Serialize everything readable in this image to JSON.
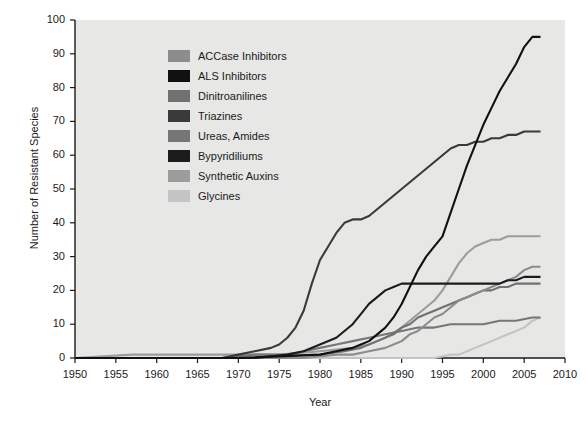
{
  "chart_data": {
    "type": "line",
    "title": "",
    "xlabel": "Year",
    "ylabel": "Number of Resistant Species",
    "xlim": [
      1950,
      2010
    ],
    "ylim": [
      0,
      100
    ],
    "xticks": [
      1950,
      1955,
      1960,
      1965,
      1970,
      1975,
      1980,
      1985,
      1990,
      1995,
      2000,
      2005,
      2010
    ],
    "yticks": [
      0,
      10,
      20,
      30,
      40,
      50,
      60,
      70,
      80,
      90,
      100
    ],
    "grid": false,
    "legend_position": "upper-left-inside",
    "background": "#e7e7e5",
    "series": [
      {
        "name": "ACCase Inhibitors",
        "color": "#8c8c8c",
        "x": [
          1950,
          1970,
          1978,
          1982,
          1984,
          1986,
          1988,
          1989,
          1990,
          1991,
          1992,
          1993,
          1994,
          1995,
          1996,
          1997,
          1998,
          1999,
          2000,
          2001,
          2002,
          2003,
          2004,
          2005,
          2006,
          2007
        ],
        "values": [
          0,
          0,
          0,
          1,
          1,
          2,
          3,
          4,
          5,
          7,
          8,
          10,
          12,
          13,
          15,
          17,
          18,
          19,
          20,
          21,
          22,
          23,
          24,
          26,
          27,
          27
        ]
      },
      {
        "name": "ALS Inhibitors",
        "color": "#111111",
        "x": [
          1950,
          1970,
          1980,
          1982,
          1984,
          1985,
          1986,
          1987,
          1988,
          1989,
          1990,
          1991,
          1992,
          1993,
          1994,
          1995,
          1996,
          1997,
          1998,
          1999,
          2000,
          2001,
          2002,
          2003,
          2004,
          2005,
          2006,
          2007
        ],
        "values": [
          0,
          0,
          1,
          2,
          3,
          4,
          5,
          7,
          9,
          12,
          16,
          21,
          26,
          30,
          33,
          36,
          43,
          50,
          57,
          63,
          69,
          74,
          79,
          83,
          87,
          92,
          95,
          95
        ]
      },
      {
        "name": "Dinitroanilines",
        "color": "#717171",
        "x": [
          1950,
          1970,
          1980,
          1983,
          1985,
          1987,
          1989,
          1990,
          1991,
          1992,
          1993,
          1994,
          1995,
          1996,
          1997,
          1998,
          1999,
          2000,
          2001,
          2002,
          2003,
          2004,
          2005,
          2006,
          2007
        ],
        "values": [
          0,
          0,
          1,
          2,
          3,
          5,
          7,
          9,
          10,
          12,
          13,
          14,
          15,
          16,
          17,
          18,
          19,
          20,
          20,
          21,
          21,
          22,
          22,
          22,
          22
        ]
      },
      {
        "name": "Triazines",
        "color": "#3a3a3a",
        "x": [
          1950,
          1968,
          1970,
          1972,
          1974,
          1975,
          1976,
          1977,
          1978,
          1979,
          1980,
          1981,
          1982,
          1983,
          1984,
          1985,
          1986,
          1987,
          1988,
          1989,
          1990,
          1991,
          1992,
          1993,
          1994,
          1995,
          1996,
          1997,
          1998,
          1999,
          2000,
          2001,
          2002,
          2003,
          2004,
          2005,
          2006,
          2007
        ],
        "values": [
          0,
          0,
          1,
          2,
          3,
          4,
          6,
          9,
          14,
          22,
          29,
          33,
          37,
          40,
          41,
          41,
          42,
          44,
          46,
          48,
          50,
          52,
          54,
          56,
          58,
          60,
          62,
          63,
          63,
          64,
          64,
          65,
          65,
          66,
          66,
          67,
          67,
          67
        ]
      },
      {
        "name": "Ureas, Amides",
        "color": "#767676",
        "x": [
          1950,
          1968,
          1972,
          1976,
          1978,
          1980,
          1982,
          1984,
          1986,
          1988,
          1990,
          1992,
          1994,
          1996,
          1998,
          2000,
          2002,
          2004,
          2006,
          2007
        ],
        "values": [
          0,
          0,
          1,
          1,
          2,
          3,
          4,
          5,
          6,
          7,
          8,
          9,
          9,
          10,
          10,
          10,
          11,
          11,
          12,
          12
        ]
      },
      {
        "name": "Bypyridiliums",
        "color": "#1c1c1c",
        "x": [
          1950,
          1972,
          1976,
          1978,
          1980,
          1982,
          1984,
          1985,
          1986,
          1987,
          1988,
          1989,
          1990,
          1992,
          1994,
          1996,
          1998,
          2000,
          2002,
          2003,
          2004,
          2005,
          2006,
          2007
        ],
        "values": [
          0,
          0,
          1,
          2,
          4,
          6,
          10,
          13,
          16,
          18,
          20,
          21,
          22,
          22,
          22,
          22,
          22,
          22,
          22,
          23,
          23,
          24,
          24,
          24
        ]
      },
      {
        "name": "Synthetic Auxins",
        "color": "#9c9c9c",
        "x": [
          1950,
          1957,
          1960,
          1965,
          1970,
          1975,
          1980,
          1984,
          1986,
          1988,
          1990,
          1992,
          1994,
          1995,
          1996,
          1997,
          1998,
          1999,
          2000,
          2001,
          2002,
          2003,
          2004,
          2005,
          2006,
          2007
        ],
        "values": [
          0,
          1,
          1,
          1,
          1,
          1,
          2,
          3,
          4,
          6,
          9,
          13,
          17,
          20,
          24,
          28,
          31,
          33,
          34,
          35,
          35,
          36,
          36,
          36,
          36,
          36
        ]
      },
      {
        "name": "Glycines",
        "color": "#c4c4c4",
        "x": [
          1950,
          1990,
          1994,
          1996,
          1997,
          1998,
          1999,
          2000,
          2001,
          2002,
          2003,
          2004,
          2005,
          2006,
          2007
        ],
        "values": [
          0,
          0,
          0,
          1,
          1,
          2,
          3,
          4,
          5,
          6,
          7,
          8,
          9,
          11,
          12
        ]
      }
    ]
  },
  "axis": {
    "x_title": "Year",
    "y_title": "Number of Resistant Species"
  }
}
